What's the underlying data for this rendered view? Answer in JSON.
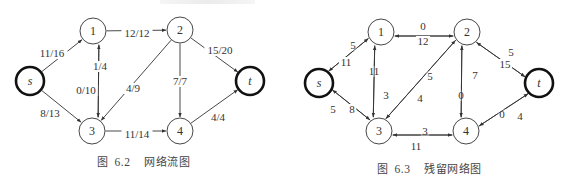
{
  "figures": [
    {
      "id": "left",
      "caption": {
        "prefix": "图",
        "number": "6.2",
        "title": "网络流图"
      },
      "caption_pos": {
        "x": 97,
        "y": 153
      },
      "nodes": [
        {
          "id": "s",
          "label": "s",
          "x": 30,
          "y": 81,
          "r": 14,
          "bold": true,
          "italic": true
        },
        {
          "id": "1",
          "label": "1",
          "x": 93,
          "y": 31,
          "r": 13,
          "bold": false,
          "italic": false
        },
        {
          "id": "2",
          "label": "2",
          "x": 180,
          "y": 30,
          "r": 13,
          "bold": false,
          "italic": false
        },
        {
          "id": "3",
          "label": "3",
          "x": 92,
          "y": 131,
          "r": 13,
          "bold": false,
          "italic": false
        },
        {
          "id": "4",
          "label": "4",
          "x": 180,
          "y": 131,
          "r": 13,
          "bold": false,
          "italic": false
        },
        {
          "id": "t",
          "label": "t",
          "x": 250,
          "y": 81,
          "r": 14,
          "bold": true,
          "italic": true
        }
      ],
      "edges": [
        {
          "from": "s",
          "to": "1",
          "label": "11/16",
          "offset": 0,
          "lx": 52,
          "ly": 53
        },
        {
          "from": "s",
          "to": "3",
          "label": "8/13",
          "offset": 0,
          "lx": 50,
          "ly": 113
        },
        {
          "from": "1",
          "to": "2",
          "label": "12/12",
          "offset": 0,
          "lx": 137,
          "ly": 33
        },
        {
          "from": "1",
          "to": "3",
          "label": "0/10",
          "offset": -6,
          "lx": 86,
          "ly": 90
        },
        {
          "from": "3",
          "to": "1",
          "label": "1/4",
          "offset": -6,
          "lx": 100,
          "ly": 66
        },
        {
          "from": "2",
          "to": "3",
          "label": "4/9",
          "offset": 0,
          "lx": 133,
          "ly": 88
        },
        {
          "from": "2",
          "to": "4",
          "label": "7/7",
          "offset": 0,
          "lx": 180,
          "ly": 81
        },
        {
          "from": "2",
          "to": "t",
          "label": "15/20",
          "offset": 0,
          "lx": 220,
          "ly": 50
        },
        {
          "from": "3",
          "to": "4",
          "label": "11/14",
          "offset": 0,
          "lx": 137,
          "ly": 134
        },
        {
          "from": "4",
          "to": "t",
          "label": "4/4",
          "offset": 0,
          "lx": 218,
          "ly": 117
        }
      ]
    },
    {
      "id": "right",
      "caption": {
        "prefix": "图",
        "number": "6.3",
        "title": "残留网络图"
      },
      "caption_pos": {
        "x": 377,
        "y": 160
      },
      "nodes": [
        {
          "id": "s",
          "label": "s",
          "x": 319,
          "y": 83,
          "r": 14,
          "bold": true,
          "italic": true
        },
        {
          "id": "1",
          "label": "1",
          "x": 381,
          "y": 32,
          "r": 13,
          "bold": false,
          "italic": false
        },
        {
          "id": "2",
          "label": "2",
          "x": 467,
          "y": 32,
          "r": 13,
          "bold": false,
          "italic": false
        },
        {
          "id": "3",
          "label": "3",
          "x": 379,
          "y": 131,
          "r": 13,
          "bold": false,
          "italic": false
        },
        {
          "id": "4",
          "label": "4",
          "x": 466,
          "y": 131,
          "r": 13,
          "bold": false,
          "italic": false
        },
        {
          "id": "t",
          "label": "t",
          "x": 539,
          "y": 83,
          "r": 14,
          "bold": true,
          "italic": true
        }
      ],
      "edges": [
        {
          "from": "s",
          "to": "1",
          "label": "5",
          "offset": 3,
          "lx": 353,
          "ly": 45
        },
        {
          "from": "1",
          "to": "s",
          "label": "11",
          "offset": 3,
          "lx": 346,
          "ly": 62
        },
        {
          "from": "1",
          "to": "2",
          "label": "0",
          "offset": 4,
          "lx": 423,
          "ly": 26
        },
        {
          "from": "2",
          "to": "1",
          "label": "12",
          "offset": 4,
          "lx": 423,
          "ly": 41
        },
        {
          "from": "1",
          "to": "3",
          "label": "11",
          "offset": 6,
          "lx": 374,
          "ly": 71
        },
        {
          "from": "3",
          "to": "1",
          "label": "3",
          "offset": 6,
          "lx": 386,
          "ly": 95
        },
        {
          "from": "s",
          "to": "3",
          "label": "5",
          "offset": 3,
          "lx": 333,
          "ly": 109
        },
        {
          "from": "3",
          "to": "s",
          "label": "8",
          "offset": 3,
          "lx": 352,
          "ly": 109
        },
        {
          "from": "3",
          "to": "2",
          "label": "5",
          "offset": 3,
          "lx": 430,
          "ly": 76
        },
        {
          "from": "2",
          "to": "3",
          "label": "4",
          "offset": 3,
          "lx": 420,
          "ly": 98
        },
        {
          "from": "4",
          "to": "2",
          "label": "0",
          "offset": 5,
          "lx": 461,
          "ly": 95
        },
        {
          "from": "2",
          "to": "4",
          "label": "7",
          "offset": 5,
          "lx": 475,
          "ly": 75
        },
        {
          "from": "2",
          "to": "t",
          "label": "5",
          "offset": 3,
          "lx": 511,
          "ly": 52
        },
        {
          "from": "t",
          "to": "2",
          "label": "15",
          "offset": 3,
          "lx": 505,
          "ly": 64
        },
        {
          "from": "3",
          "to": "4",
          "label": "3",
          "offset": 4,
          "lx": 425,
          "ly": 131
        },
        {
          "from": "4",
          "to": "3",
          "label": "11",
          "offset": 4,
          "lx": 416,
          "ly": 146
        },
        {
          "from": "4",
          "to": "t",
          "label": "0",
          "offset": 3,
          "lx": 502,
          "ly": 114
        },
        {
          "from": "t",
          "to": "4",
          "label": "4",
          "offset": 3,
          "lx": 520,
          "ly": 116
        }
      ]
    }
  ],
  "style": {
    "stroke": "#333333",
    "node_fill": "#ffffff",
    "bold_node_stroke": "#111111"
  }
}
